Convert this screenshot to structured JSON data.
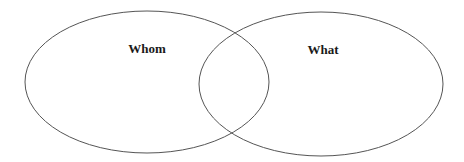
{
  "diagram": {
    "type": "venn",
    "sets": [
      {
        "id": "left",
        "label": "Whom",
        "ellipse": {
          "cx": 147,
          "cy": 82,
          "rx": 122,
          "ry": 71
        },
        "label_pos": {
          "x": 147,
          "y": 50
        }
      },
      {
        "id": "right",
        "label": "What",
        "ellipse": {
          "cx": 321,
          "cy": 84,
          "rx": 122,
          "ry": 72
        },
        "label_pos": {
          "x": 323,
          "y": 51
        }
      }
    ],
    "stroke_color": "#555555",
    "label_color": "#1a1a1a",
    "background": "#ffffff"
  }
}
